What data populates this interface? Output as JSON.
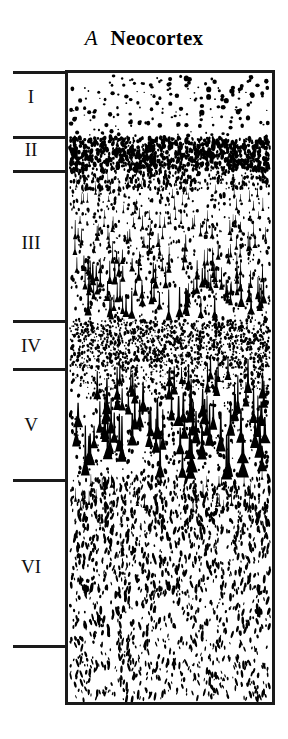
{
  "figure": {
    "panel_letter": "A",
    "title": "Neocortex"
  },
  "layers": [
    {
      "numeral": "I",
      "label_top": 87,
      "cell_pattern": "sparse-small-round"
    },
    {
      "numeral": "II",
      "label_top": 140,
      "cell_pattern": "very-dense-small-granular"
    },
    {
      "numeral": "III",
      "label_top": 233,
      "cell_pattern": "medium-pyramidal-increasing-size"
    },
    {
      "numeral": "IV",
      "label_top": 336,
      "cell_pattern": "dense-tiny-granular"
    },
    {
      "numeral": "V",
      "label_top": 415,
      "cell_pattern": "large-pyramidal"
    },
    {
      "numeral": "VI",
      "label_top": 557,
      "cell_pattern": "medium-dense-small-fusiform"
    }
  ],
  "ticks": [
    {
      "name": "tick-top-boundary",
      "y": 71
    },
    {
      "name": "tick-layer-I-II",
      "y": 136
    },
    {
      "name": "tick-layer-II-III",
      "y": 170
    },
    {
      "name": "tick-layer-III-IV",
      "y": 320
    },
    {
      "name": "tick-layer-IV-V",
      "y": 368
    },
    {
      "name": "tick-layer-V-VI",
      "y": 479
    },
    {
      "name": "tick-bottom-boundary",
      "y": 645
    }
  ],
  "colors": {
    "ink": "#1a1a1a",
    "background": "#ffffff",
    "cell": "#000000"
  },
  "chart_data": {
    "type": "heatmap",
    "title": "Neocortex",
    "subtitle": "A",
    "xlabel": "",
    "ylabel": "Cortical layer",
    "categories": [
      "I",
      "II",
      "III",
      "IV",
      "V",
      "VI"
    ],
    "series": [
      {
        "name": "relative cell density",
        "values": [
          12,
          95,
          48,
          88,
          42,
          62
        ]
      },
      {
        "name": "relative cell size",
        "values": [
          10,
          18,
          55,
          14,
          92,
          28
        ]
      }
    ],
    "layer_bands": [
      {
        "layer": "I",
        "y_top": 71,
        "y_bottom": 136,
        "thickness_px": 65,
        "density": "sparse",
        "dominant_cell": "small round"
      },
      {
        "layer": "II",
        "y_top": 136,
        "y_bottom": 170,
        "thickness_px": 34,
        "density": "very dense",
        "dominant_cell": "small granular"
      },
      {
        "layer": "III",
        "y_top": 170,
        "y_bottom": 320,
        "thickness_px": 150,
        "density": "moderate",
        "dominant_cell": "pyramidal, size increasing with depth"
      },
      {
        "layer": "IV",
        "y_top": 320,
        "y_bottom": 368,
        "thickness_px": 48,
        "density": "dense",
        "dominant_cell": "tiny granular"
      },
      {
        "layer": "V",
        "y_top": 368,
        "y_bottom": 479,
        "thickness_px": 111,
        "density": "moderate",
        "dominant_cell": "large pyramidal"
      },
      {
        "layer": "VI",
        "y_top": 479,
        "y_bottom": 645,
        "thickness_px": 166,
        "density": "moderate",
        "dominant_cell": "small fusiform"
      }
    ],
    "axis_ranges": {
      "y_px": [
        71,
        705
      ]
    },
    "grid": false,
    "legend": "none"
  }
}
